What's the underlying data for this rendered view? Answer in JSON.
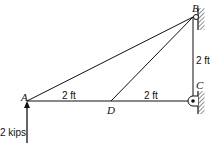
{
  "diagram": {
    "points": {
      "A": "A",
      "B": "B",
      "C": "C",
      "D": "D"
    },
    "dimensions": {
      "AD": "2 ft",
      "DC": "2 ft",
      "CB": "2 ft"
    },
    "load": {
      "label": "2 kips",
      "direction": "up",
      "at": "A"
    },
    "members": [
      "AB",
      "DB",
      "AD",
      "DC",
      "CB"
    ],
    "supports": {
      "B": "pin to wall",
      "C": "pin to wall"
    },
    "colors": {
      "line": "#111111",
      "background": "#ffffff"
    }
  }
}
